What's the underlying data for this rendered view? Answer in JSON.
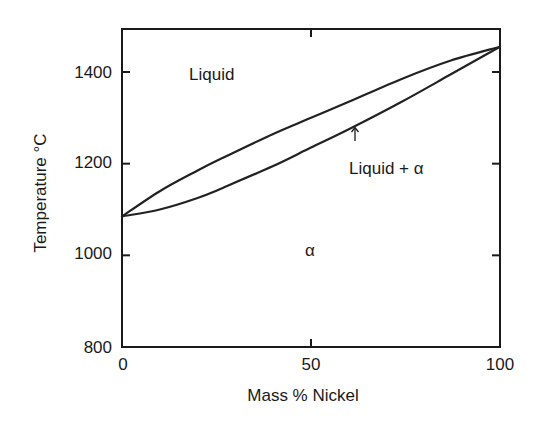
{
  "chart_data": {
    "type": "line",
    "title": "",
    "xlabel": "Mass % Nickel",
    "ylabel": "Temperature °C",
    "xlim": [
      0,
      100
    ],
    "ylim": [
      800,
      1500
    ],
    "grid": false,
    "legend": null,
    "x_ticks": [
      0,
      50,
      100
    ],
    "x_tick_labels": [
      "0",
      "50",
      "100"
    ],
    "y_ticks": [
      800,
      1000,
      1200,
      1400
    ],
    "y_tick_labels": [
      "800",
      "1000",
      "1200",
      "1400"
    ],
    "series": [
      {
        "name": "Liquidus",
        "x": [
          0,
          10,
          20,
          26,
          40,
          50,
          60,
          74,
          87,
          100
        ],
        "values": [
          1085,
          1140,
          1185,
          1210,
          1265,
          1300,
          1335,
          1385,
          1425,
          1455
        ]
      },
      {
        "name": "Solidus",
        "x": [
          0,
          10,
          20,
          26,
          40,
          50,
          60,
          74,
          87,
          100
        ],
        "values": [
          1085,
          1100,
          1125,
          1145,
          1195,
          1235,
          1275,
          1335,
          1395,
          1455
        ]
      }
    ],
    "annotations": [
      {
        "text": "Liquid",
        "x": 18,
        "y": 1400
      },
      {
        "text": "Liquid + α",
        "x": 72,
        "y": 1215,
        "arrow_to": {
          "x": 62,
          "y": 1290
        }
      },
      {
        "text": "α",
        "x": 50,
        "y": 1000
      }
    ]
  },
  "labels": {
    "xlabel": "Mass % Nickel",
    "ylabel": "Temperature °C",
    "region_liquid": "Liquid",
    "region_two_phase": "Liquid + α",
    "region_alpha": "α",
    "arrow_glyph": "↑",
    "xticks": [
      "0",
      "50",
      "100"
    ],
    "yticks": [
      "800",
      "1000",
      "1200",
      "1400"
    ]
  }
}
